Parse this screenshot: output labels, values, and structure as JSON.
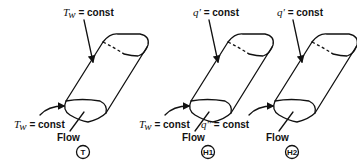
{
  "figure": {
    "panels": [
      {
        "id": "T",
        "badge": "T",
        "top_label": {
          "symbol": "T",
          "subscript": "w",
          "text": " = const"
        },
        "inlet_label": {
          "symbol": "T",
          "subscript": "w",
          "text": " = const"
        },
        "flow_label": "Flow"
      },
      {
        "id": "H1",
        "badge": "H1",
        "top_label": {
          "symbol": "q′",
          "subscript": "",
          "text": " = const"
        },
        "inlet_label": {
          "symbol": "T",
          "subscript": "w",
          "text": " = const"
        },
        "flow_label": "Flow"
      },
      {
        "id": "H2",
        "badge": "H2",
        "top_label": {
          "symbol": "q′",
          "subscript": "",
          "text": " = const"
        },
        "inlet_label": {
          "symbol": "q″",
          "subscript": "",
          "text": " = const"
        },
        "flow_label": "Flow"
      }
    ]
  }
}
